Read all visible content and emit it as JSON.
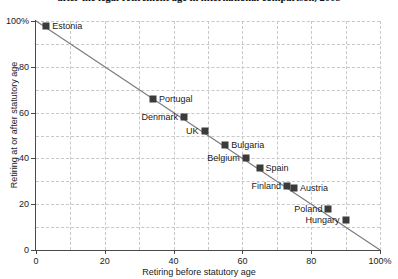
{
  "chart_data": {
    "type": "scatter",
    "title": "after the legal retirement age in international comparison, 2008",
    "xlabel": "Retiring before statutory age",
    "ylabel": "Retiring at or after statutory age",
    "xlim": [
      0,
      100
    ],
    "ylim": [
      0,
      100
    ],
    "xticks": [
      "0",
      "20",
      "40",
      "60",
      "80",
      "100%"
    ],
    "xtickvalues": [
      0,
      20,
      40,
      60,
      80,
      100
    ],
    "yticks": [
      "0",
      "20",
      "40",
      "60",
      "80",
      "100%"
    ],
    "ytickvalues": [
      0,
      20,
      40,
      60,
      80,
      100
    ],
    "grid": "dashed-both-10-unit",
    "legend": "none",
    "annotation": "points lie on the line y = 100 - x",
    "marker_color": "#3b3b3b",
    "line_color": "#7a7a7a",
    "grid_color": "#c8c8c8",
    "axis_color": "#4a4a4a",
    "points": [
      {
        "label": "Estonia",
        "x": 3,
        "y": 98,
        "side": "right"
      },
      {
        "label": "Portugal",
        "x": 34,
        "y": 66,
        "side": "right"
      },
      {
        "label": "Denmark",
        "x": 43,
        "y": 58,
        "side": "left"
      },
      {
        "label": "UK",
        "x": 49,
        "y": 52,
        "side": "left"
      },
      {
        "label": "Bulgaria",
        "x": 55,
        "y": 46,
        "side": "right"
      },
      {
        "label": "Belgium",
        "x": 61,
        "y": 40,
        "side": "left"
      },
      {
        "label": "Spain",
        "x": 65,
        "y": 36,
        "side": "right"
      },
      {
        "label": "Finland",
        "x": 73,
        "y": 28,
        "side": "left"
      },
      {
        "label": "Austria",
        "x": 75,
        "y": 27,
        "side": "right"
      },
      {
        "label": "Poland",
        "x": 85,
        "y": 18,
        "side": "left"
      },
      {
        "label": "Hungary",
        "x": 90,
        "y": 13,
        "side": "left"
      }
    ]
  }
}
